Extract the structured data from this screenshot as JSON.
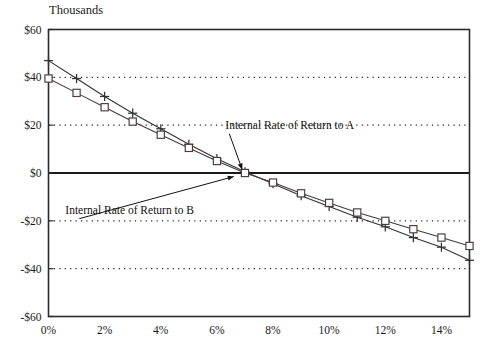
{
  "chart_data": {
    "type": "line",
    "title": "Thousands",
    "xlabel": "",
    "ylabel": "",
    "xlim": [
      0,
      15
    ],
    "ylim": [
      -60,
      60
    ],
    "grid": true,
    "legend_position": "none",
    "x_ticks": [
      "0%",
      "2%",
      "4%",
      "6%",
      "8%",
      "10%",
      "12%",
      "14%"
    ],
    "x_tick_values": [
      0,
      2,
      4,
      6,
      8,
      10,
      12,
      14
    ],
    "y_ticks": [
      "$60",
      "$40",
      "$20",
      "$0",
      "-$20",
      "-$40",
      "-$60"
    ],
    "y_tick_values": [
      60,
      40,
      20,
      0,
      -20,
      -40,
      -60
    ],
    "x": [
      0,
      1,
      2,
      3,
      4,
      5,
      6,
      7,
      8,
      9,
      10,
      11,
      12,
      13,
      14,
      15
    ],
    "series": [
      {
        "name": "Internal Rate of Return to A",
        "marker": "plus",
        "color": "#333333",
        "values": [
          47.0,
          39.5,
          32.0,
          25.0,
          18.5,
          12.0,
          6.0,
          0.5,
          -4.5,
          -9.5,
          -14.0,
          -18.5,
          -22.5,
          -27.0,
          -31.0,
          -36.5
        ]
      },
      {
        "name": "Internal Rate of Return to B",
        "marker": "square",
        "color": "#4a3a3a",
        "values": [
          39.5,
          33.5,
          27.5,
          21.5,
          16.0,
          10.5,
          5.0,
          0.0,
          -4.0,
          -8.5,
          -12.5,
          -16.5,
          -20.0,
          -23.5,
          -27.0,
          -30.5
        ]
      }
    ],
    "annotations": [
      {
        "text": "Internal Rate of Return to A",
        "text_x": 6.3,
        "text_y": 18.5,
        "arrow_to_x": 6.9,
        "arrow_to_y": 1.5
      },
      {
        "text": "Internal Rate of Return to B",
        "text_x": 0.6,
        "text_y": -17.0,
        "arrow_to_x": 6.6,
        "arrow_to_y": -1.5
      }
    ],
    "gridline_values": [
      40,
      20,
      -20,
      -40
    ],
    "zero_line_value": 0
  }
}
